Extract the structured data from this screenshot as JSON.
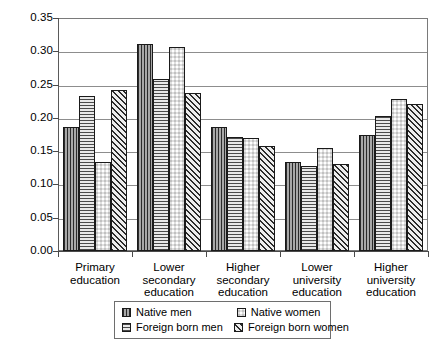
{
  "chart_data": {
    "type": "bar",
    "title": "",
    "subtitle": "",
    "xlabel": "",
    "ylabel": "",
    "ylim": [
      0.0,
      0.35
    ],
    "ytick_labels": [
      "0.35",
      "0.30",
      "0.25",
      "0.20",
      "0.15",
      "0.10",
      "0.05",
      "0.00"
    ],
    "ytick_values": [
      0.35,
      0.3,
      0.25,
      0.2,
      0.15,
      0.1,
      0.05,
      0.0
    ],
    "grid": "horizontal",
    "legend_position": "bottom",
    "categories": [
      "Primary education",
      "Lower secondary education",
      "Higher secondary education",
      "Lower university education",
      "Higher university education"
    ],
    "category_lines": [
      [
        "Primary",
        "education"
      ],
      [
        "Lower",
        "secondary",
        "education"
      ],
      [
        "Higher",
        "secondary",
        "education"
      ],
      [
        "Lower",
        "university",
        "education"
      ],
      [
        "Higher",
        "university",
        "education"
      ]
    ],
    "series": [
      {
        "name": "Native men",
        "pattern": "vertical-stripes",
        "values": [
          0.186,
          0.311,
          0.187,
          0.134,
          0.175
        ]
      },
      {
        "name": "Foreign born men",
        "pattern": "horizontal-stripes",
        "values": [
          0.233,
          0.259,
          0.171,
          0.127,
          0.203
        ]
      },
      {
        "name": "Native women",
        "pattern": "checkerboard",
        "values": [
          0.133,
          0.306,
          0.17,
          0.154,
          0.228
        ]
      },
      {
        "name": "Foreign born women",
        "pattern": "diagonal-hatch",
        "values": [
          0.242,
          0.238,
          0.158,
          0.131,
          0.221
        ]
      }
    ]
  },
  "legend": {
    "entries": [
      {
        "label": "Native men",
        "pattern": "vertical-stripes"
      },
      {
        "label": "Native women",
        "pattern": "checkerboard"
      },
      {
        "label": "Foreign born men",
        "pattern": "horizontal-stripes"
      },
      {
        "label": "Foreign born women",
        "pattern": "diagonal-hatch"
      }
    ]
  },
  "colors": {
    "axis": "#4a4a4a",
    "gridline": "#8d8d8d",
    "frame": "#7a7a7a",
    "bar_outline": "#1a1a1a",
    "background": "#ffffff",
    "text": "#000000"
  }
}
